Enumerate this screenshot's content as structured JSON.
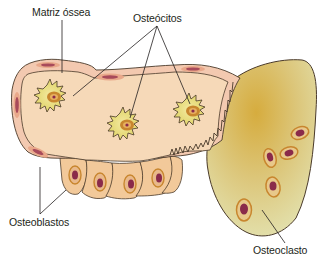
{
  "labels": {
    "matrix": "Matriz óssea",
    "osteocytes": "Osteócitos",
    "osteoblasts": "Osteoblastos",
    "osteoclast": "Osteoclasto"
  },
  "colors": {
    "matrix_fill": "#f6d9b8",
    "lining_cell_fill": "#f3c9b0",
    "osteoblast_fill": "#f2c99a",
    "osteoclast_fill": "#dfd79a",
    "osteoclast_center": "#d9b24a",
    "nucleus": "#8a2a4a",
    "nucleus_ring": "#d48a3a",
    "osteocyte_halo": "#e9e08a",
    "outline": "#4a3a2a"
  }
}
